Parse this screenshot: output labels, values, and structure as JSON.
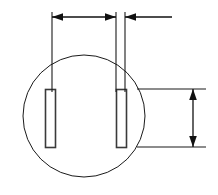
{
  "drawing": {
    "title": "Technical part outline with two slots and dimensions",
    "line_color": "#1a1a1a",
    "slot_stroke_color": "#3a3a3a",
    "background_color": "#ffffff",
    "body": {
      "shape_name": "circle-outline",
      "center_x": 84,
      "center_y": 116,
      "radius": 61
    },
    "slots": [
      {
        "name": "left-slot",
        "x": 45,
        "y": 89,
        "width": 10,
        "height": 58
      },
      {
        "name": "right-slot",
        "x": 116,
        "y": 89,
        "width": 10,
        "height": 58
      }
    ],
    "extension_lines": [
      {
        "name": "left-vertical-extension",
        "x1": 52,
        "y1": 12,
        "x2": 52,
        "y2": 92
      },
      {
        "name": "center-vertical-extension",
        "x1": 116,
        "y1": 12,
        "x2": 116,
        "y2": 92
      },
      {
        "name": "right-vertical-extension",
        "x1": 125,
        "y1": 12,
        "x2": 125,
        "y2": 92
      },
      {
        "name": "top-horizontal-extension",
        "x1": 137,
        "y1": 89,
        "x2": 206,
        "y2": 89
      },
      {
        "name": "bottom-horizontal-extension",
        "x1": 137,
        "y1": 147,
        "x2": 206,
        "y2": 147
      }
    ],
    "dimensions": [
      {
        "name": "horizontal-slot-spacing-dimension",
        "orientation": "horizontal",
        "label": "",
        "y": 17,
        "from_x": 52,
        "to_x": 116,
        "arrow_start": "left",
        "arrow_end": "right"
      },
      {
        "name": "horizontal-slot-width-dimension",
        "orientation": "horizontal",
        "label": "",
        "y": 17,
        "from_x": 125,
        "to_x": 172,
        "arrow_start": "left",
        "arrow_end": "none"
      },
      {
        "name": "vertical-slot-length-dimension",
        "orientation": "vertical",
        "label": "",
        "x": 193,
        "from_y": 89,
        "to_y": 147,
        "arrow_start": "up",
        "arrow_end": "down"
      }
    ]
  }
}
